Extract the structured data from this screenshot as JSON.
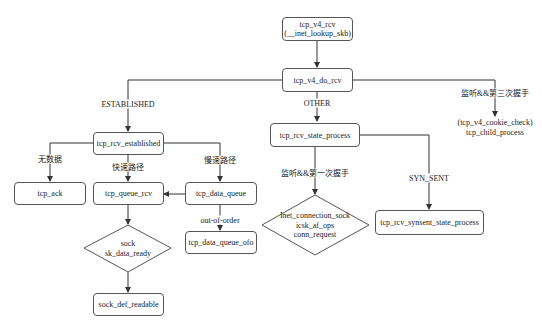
{
  "diagram": {
    "nodes": {
      "tcp_v4_rcv": {
        "line1": "tcp_v4_rcv",
        "line2": "(__inet_lookup_skb)"
      },
      "tcp_v4_do_rcv": "tcp_v4_do_rcv",
      "tcp_rcv_established": "tcp_rcv_established",
      "tcp_ack": "tcp_ack",
      "tcp_queue_rcv": "tcp_queue_rcv",
      "tcp_data_queue": "tcp_data_queue",
      "tcp_data_queue_ofo": "tcp_data_queue_ofo",
      "sock_decision": {
        "line1": "sock",
        "line2": "sk_data_ready"
      },
      "sock_def_readable": "sock_def_readable",
      "tcp_rcv_state_process": "tcp_rcv_state_process",
      "inet_decision": {
        "line1": "Inet_connection_sock",
        "line2": "icsk_af_ops",
        "line3": "conn_request"
      },
      "tcp_rcv_synsent_state_process": "tcp_rcv_synsent_state_process",
      "cookie_check": {
        "line1": "(tcp_v4_cookie_check)",
        "line2": "tcp_child_process"
      }
    },
    "edge_labels": {
      "established": "ESTABLISHED",
      "other": "OTHER",
      "listen_third": "监听&&第三次握手",
      "no_data": "无数据",
      "fast_path": "快速路径",
      "slow_path": "慢速路径",
      "out_of_order": "out-of-order",
      "listen_first": "监听&&第一次握手",
      "syn_sent": "SYN_SENT"
    },
    "colors": {
      "line": "#333333",
      "border": "#555555"
    }
  }
}
